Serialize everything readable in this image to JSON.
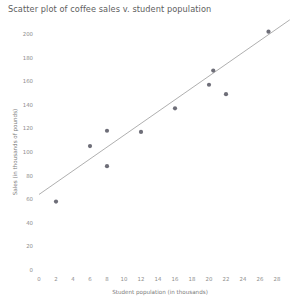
{
  "chart_data": {
    "type": "scatter",
    "title": "Scatter plot of coffee sales v. student population",
    "xlabel": "Student population (in thousands)",
    "ylabel": "Sales (in thousands of pounds)",
    "xlim": [
      0,
      28
    ],
    "ylim": [
      0,
      200
    ],
    "xticks": [
      0,
      2,
      4,
      6,
      8,
      10,
      12,
      14,
      16,
      18,
      20,
      22,
      24,
      26,
      28
    ],
    "yticks": [
      0,
      20,
      40,
      60,
      80,
      100,
      120,
      140,
      160,
      180,
      200
    ],
    "grid": false,
    "legend": null,
    "marker_color": "#6e6e78",
    "trendline_color": "#9a9a9a",
    "points": [
      {
        "x": 2,
        "y": 58
      },
      {
        "x": 6,
        "y": 105
      },
      {
        "x": 8,
        "y": 118
      },
      {
        "x": 8,
        "y": 88
      },
      {
        "x": 12,
        "y": 117
      },
      {
        "x": 16,
        "y": 137
      },
      {
        "x": 20,
        "y": 157
      },
      {
        "x": 20.5,
        "y": 169
      },
      {
        "x": 22,
        "y": 149
      },
      {
        "x": 27,
        "y": 202
      }
    ],
    "trendline": {
      "x0": 0,
      "y0": 64,
      "x1": 29.5,
      "y1": 212
    }
  }
}
